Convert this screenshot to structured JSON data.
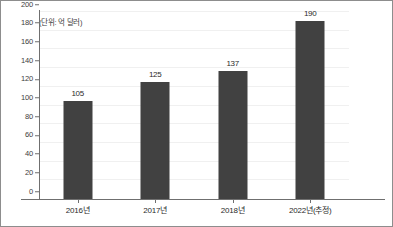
{
  "chart_data": {
    "type": "bar",
    "title": "",
    "subtitle": "",
    "xlabel": "",
    "ylabel": "",
    "unit_note": "(단위: 억 달러)",
    "categories": [
      "2016년",
      "2017년",
      "2018년",
      "2022년(추정)"
    ],
    "values": [
      105,
      125,
      137,
      190
    ],
    "series": [
      {
        "name": "",
        "values": [
          105,
          125,
          137,
          190
        ]
      }
    ],
    "data_labels": [
      "105",
      "125",
      "137",
      "190"
    ],
    "ylim": [
      0,
      200
    ],
    "ytick_step": 20,
    "ytick_labels": [
      "200",
      "180",
      "160",
      "140",
      "120",
      "100",
      "80",
      "60",
      "40",
      "20",
      "0"
    ],
    "ytick_values": [
      200,
      180,
      160,
      140,
      120,
      100,
      80,
      60,
      40,
      20,
      0
    ],
    "grid": true,
    "legend": false,
    "legend_position": "none"
  },
  "style": {
    "bar_color": "#414141",
    "axis_color": "#6f6f6f",
    "grid_color": "#f0f0f0",
    "border_color": "#8d8d8d",
    "text_color": "#2b2b2b",
    "background": "#ffffff"
  }
}
